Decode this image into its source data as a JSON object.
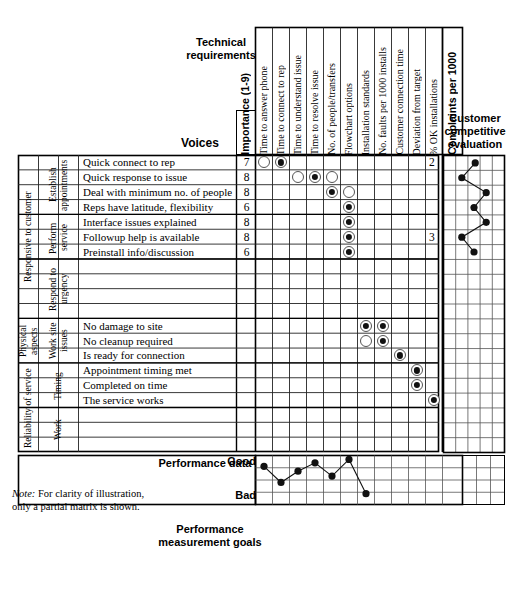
{
  "headings": {
    "technical_requirements": "Technical requirements",
    "voices": "Voices",
    "customer_competitive_evaluation": "Customer competitive evaluation",
    "performance_data": "Performance data",
    "performance_measurement_goals": "Performance measurement goals",
    "importance_column": "Importance (1-9)",
    "complaints_column": "Complaints per 1000",
    "scale_good": "Good",
    "scale_bad": "Bad"
  },
  "note": {
    "prefix": "Note:",
    "line1": " For clarity of illustration,",
    "line2": "only a partial matrix is shown."
  },
  "columns": [
    "Time to answer phone",
    "Time to connect to rep",
    "Time to understand issue",
    "Time to resolve issue",
    "No. of people/transfers",
    "Flowchart options",
    "Installation standards",
    "No. faults per 1000 installs",
    "Customer connection time",
    "Deviation from target",
    "% OK installations"
  ],
  "row_groups": [
    {
      "level1": "Responsive to customer",
      "level2": [
        {
          "label": "Establish appointments",
          "rows": 4
        },
        {
          "label": "Perform service",
          "rows": 3
        },
        {
          "label": "Respond to urgency",
          "rows": 4
        }
      ]
    },
    {
      "level1": "Physical aspects",
      "level2": [
        {
          "label": "Work site issues",
          "rows": 3
        }
      ]
    },
    {
      "level1": "Reliability of service",
      "level2": [
        {
          "label": "Timing",
          "rows": 3
        },
        {
          "label": "Work",
          "rows": 3
        }
      ]
    }
  ],
  "rows": [
    {
      "voice": "Quick connect to rep",
      "importance": "7",
      "complaints": "2"
    },
    {
      "voice": "Quick response to issue",
      "importance": "8",
      "complaints": ""
    },
    {
      "voice": "Deal with minimum no. of people",
      "importance": "8",
      "complaints": ""
    },
    {
      "voice": "Reps have latitude, flexibility",
      "importance": "6",
      "complaints": ""
    },
    {
      "voice": "Interface issues explained",
      "importance": "8",
      "complaints": ""
    },
    {
      "voice": "Followup help is available",
      "importance": "8",
      "complaints": "3"
    },
    {
      "voice": "Preinstall info/discussion",
      "importance": "6",
      "complaints": ""
    },
    {
      "voice": "",
      "importance": "",
      "complaints": ""
    },
    {
      "voice": "",
      "importance": "",
      "complaints": ""
    },
    {
      "voice": "",
      "importance": "",
      "complaints": ""
    },
    {
      "voice": "",
      "importance": "",
      "complaints": ""
    },
    {
      "voice": "No damage to site",
      "importance": "",
      "complaints": ""
    },
    {
      "voice": "No cleanup required",
      "importance": "",
      "complaints": ""
    },
    {
      "voice": "Is ready for connection",
      "importance": "",
      "complaints": ""
    },
    {
      "voice": "Appointment timing met",
      "importance": "",
      "complaints": ""
    },
    {
      "voice": "Completed on time",
      "importance": "",
      "complaints": ""
    },
    {
      "voice": "The service works",
      "importance": "",
      "complaints": ""
    },
    {
      "voice": "",
      "importance": "",
      "complaints": ""
    },
    {
      "voice": "",
      "importance": "",
      "complaints": ""
    },
    {
      "voice": "",
      "importance": "",
      "complaints": ""
    }
  ],
  "chart_data": [
    {
      "type": "heatmap",
      "title": "Relationship matrix",
      "xlabel": "Technical requirements",
      "ylabel": "Voices",
      "symbol_legend": {
        "open": "medium relationship (open circle)",
        "filled": "strong relationship (filled bullseye)"
      },
      "cells": [
        {
          "row": 0,
          "col": 0,
          "symbol": "open"
        },
        {
          "row": 0,
          "col": 1,
          "symbol": "filled"
        },
        {
          "row": 1,
          "col": 2,
          "symbol": "open"
        },
        {
          "row": 1,
          "col": 3,
          "symbol": "filled"
        },
        {
          "row": 1,
          "col": 4,
          "symbol": "open"
        },
        {
          "row": 2,
          "col": 4,
          "symbol": "filled"
        },
        {
          "row": 2,
          "col": 5,
          "symbol": "open"
        },
        {
          "row": 3,
          "col": 5,
          "symbol": "filled"
        },
        {
          "row": 4,
          "col": 5,
          "symbol": "filled"
        },
        {
          "row": 5,
          "col": 5,
          "symbol": "filled"
        },
        {
          "row": 6,
          "col": 5,
          "symbol": "filled"
        },
        {
          "row": 11,
          "col": 6,
          "symbol": "filled"
        },
        {
          "row": 11,
          "col": 7,
          "symbol": "filled"
        },
        {
          "row": 12,
          "col": 6,
          "symbol": "open"
        },
        {
          "row": 12,
          "col": 7,
          "symbol": "filled"
        },
        {
          "row": 13,
          "col": 8,
          "symbol": "filled"
        },
        {
          "row": 14,
          "col": 9,
          "symbol": "filled"
        },
        {
          "row": 15,
          "col": 9,
          "symbol": "filled"
        },
        {
          "row": 16,
          "col": 10,
          "symbol": "filled"
        }
      ]
    },
    {
      "type": "line",
      "title": "Customer competitive evaluation",
      "orientation": "vertical",
      "xlabel": "",
      "ylabel": "",
      "grid": true,
      "xlim": [
        0,
        5
      ],
      "n_points": 7,
      "points": [
        {
          "row": 0,
          "value": 2.6
        },
        {
          "row": 1,
          "value": 1.5
        },
        {
          "row": 2,
          "value": 3.5
        },
        {
          "row": 3,
          "value": 2.5
        },
        {
          "row": 4,
          "value": 3.5
        },
        {
          "row": 5,
          "value": 1.5
        },
        {
          "row": 6,
          "value": 2.5
        }
      ]
    },
    {
      "type": "line",
      "title": "Performance data",
      "xlabel": "Technical requirements",
      "ylabel": "Good / Bad",
      "grid": true,
      "ylim": [
        0,
        1
      ],
      "yticks": [
        "Good",
        "Bad"
      ],
      "categories": [
        "Time to answer phone",
        "Time to connect to rep",
        "Time to understand issue",
        "Time to resolve issue",
        "No. of people/transfers",
        "Flowchart options",
        "Installation standards",
        "No. faults per 1000 installs"
      ],
      "values": [
        0.78,
        0.45,
        0.68,
        0.85,
        0.58,
        0.92,
        0.22
      ]
    }
  ]
}
